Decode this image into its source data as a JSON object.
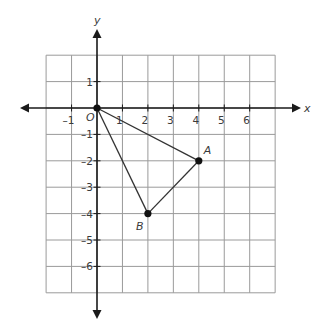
{
  "diagram": {
    "type": "coordinate-plane",
    "axes": {
      "x_label": "x",
      "y_label": "y",
      "origin_label": "O",
      "x_range": [
        -2,
        7
      ],
      "y_range": [
        -7,
        2
      ],
      "x_tick_labels": [
        "–1",
        "1",
        "2",
        "3",
        "4",
        "5",
        "6"
      ],
      "x_tick_values": [
        -1,
        1,
        2,
        3,
        4,
        5,
        6
      ],
      "y_tick_labels": [
        "1",
        "–1",
        "–2",
        "–3",
        "–4",
        "–5",
        "–6"
      ],
      "y_tick_values": [
        1,
        -1,
        -2,
        -3,
        -4,
        -5,
        -6
      ]
    },
    "points": [
      {
        "name": "O",
        "x": 0,
        "y": 0
      },
      {
        "name": "A",
        "x": 4,
        "y": -2
      },
      {
        "name": "B",
        "x": 2,
        "y": -4
      }
    ],
    "segments": [
      [
        "O",
        "A"
      ],
      [
        "A",
        "B"
      ],
      [
        "B",
        "O"
      ]
    ],
    "point_labels": {
      "A": "A",
      "B": "B"
    }
  }
}
